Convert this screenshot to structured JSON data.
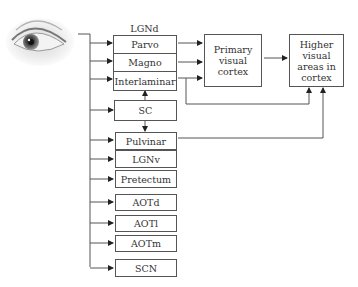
{
  "diagram": {
    "source": {
      "icon": "eye-icon"
    },
    "lgnd": {
      "title": "LGNd",
      "layers": [
        {
          "label": "Parvo"
        },
        {
          "label": "Magno"
        },
        {
          "label": "Interlaminar"
        }
      ]
    },
    "primary_cortex": {
      "label": "Primary\nvisual\ncortex"
    },
    "higher_cortex": {
      "label": "Higher\nvisual\nareas in\ncortex"
    },
    "targets": [
      {
        "label": "SC"
      },
      {
        "label": "Pulvinar"
      },
      {
        "label": "LGNv"
      },
      {
        "label": "Pretectum"
      },
      {
        "label": "AOTd"
      },
      {
        "label": "AOTl"
      },
      {
        "label": "AOTm"
      },
      {
        "label": "SCN"
      }
    ],
    "connections": [
      {
        "from": "eye",
        "to": "Parvo"
      },
      {
        "from": "eye",
        "to": "Magno"
      },
      {
        "from": "eye",
        "to": "Interlaminar"
      },
      {
        "from": "eye",
        "to": "SC"
      },
      {
        "from": "eye",
        "to": "Pulvinar"
      },
      {
        "from": "eye",
        "to": "LGNv"
      },
      {
        "from": "eye",
        "to": "Pretectum"
      },
      {
        "from": "eye",
        "to": "AOTd"
      },
      {
        "from": "eye",
        "to": "AOTl"
      },
      {
        "from": "eye",
        "to": "AOTm"
      },
      {
        "from": "eye",
        "to": "SCN"
      },
      {
        "from": "SC",
        "to": "Interlaminar"
      },
      {
        "from": "SC",
        "to": "Pulvinar"
      },
      {
        "from": "Parvo",
        "to": "Primary visual cortex"
      },
      {
        "from": "Magno",
        "to": "Primary visual cortex"
      },
      {
        "from": "Interlaminar",
        "to": "Primary visual cortex"
      },
      {
        "from": "Interlaminar",
        "to": "Higher visual areas in cortex"
      },
      {
        "from": "Primary visual cortex",
        "to": "Higher visual areas in cortex"
      },
      {
        "from": "Pulvinar",
        "to": "Higher visual areas in cortex"
      }
    ],
    "colors": {
      "line": "#555555",
      "text": "#333333",
      "background": "#ffffff"
    }
  }
}
